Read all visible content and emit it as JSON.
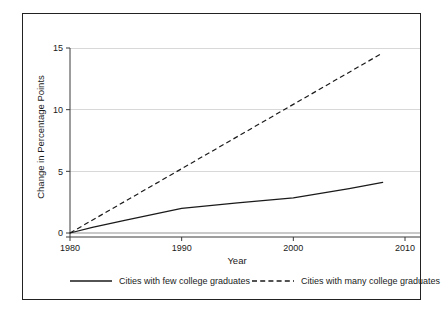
{
  "chart_data": {
    "type": "line",
    "title": "",
    "xlabel": "Year",
    "ylabel": "Change in Percentage Points",
    "xlim": [
      1980,
      2010
    ],
    "ylim": [
      0,
      15
    ],
    "xticks": [
      1980,
      1990,
      2000,
      2010
    ],
    "xtick_labels": [
      "1980",
      "1990",
      "2000",
      "2010"
    ],
    "yticks": [
      0,
      5,
      10,
      15
    ],
    "ytick_labels": [
      "0",
      "5",
      "10",
      "15"
    ],
    "grid": "horizontal",
    "legend_position": "bottom",
    "series": [
      {
        "name": "Cities with few college graduates",
        "style": "solid",
        "color": "#1a1a1a",
        "x": [
          1980,
          1982,
          1985,
          1990,
          1995,
          2000,
          2005,
          2008
        ],
        "values": [
          0,
          0.45,
          1.05,
          2.0,
          2.45,
          2.85,
          3.6,
          4.1
        ]
      },
      {
        "name": "Cities with many college graduates",
        "style": "dashed",
        "color": "#1a1a1a",
        "x": [
          1980,
          2008
        ],
        "values": [
          0,
          14.6
        ]
      }
    ]
  },
  "axes": {
    "y_label": "Change in Percentage Points",
    "x_label": "Year"
  },
  "legend": {
    "entries": [
      {
        "label": "Cities with few college graduates",
        "style": "solid"
      },
      {
        "label": "Cities with many college graduates",
        "style": "dashed"
      }
    ]
  },
  "colors": {
    "ink": "#1a1a1a",
    "grid": "#d8d8d8",
    "frame": "#222222",
    "background": "#ffffff"
  }
}
